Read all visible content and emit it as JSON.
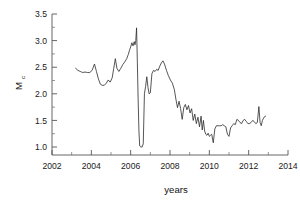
{
  "figure": {
    "background": "#ffffff",
    "line_color": "#2b2b2b",
    "axis_color": "#555555"
  },
  "chart_data": {
    "type": "line",
    "title": "",
    "subtitle": "",
    "xlabel": "years",
    "ylabel": "M",
    "ylabel_subscript": "c",
    "xlim": [
      2002,
      2014
    ],
    "ylim": [
      0.85,
      3.5
    ],
    "xticks": [
      2002,
      2004,
      2006,
      2008,
      2010,
      2012,
      2014
    ],
    "xticklabels": [
      "2002",
      "2004",
      "2006",
      "2008",
      "2010",
      "2012",
      "2014"
    ],
    "yticks": [
      1.0,
      1.5,
      2.0,
      2.5,
      3.0,
      3.5
    ],
    "yticklabels": [
      "1.0",
      "1.5",
      "2.0",
      "2.5",
      "3.0",
      "3.5"
    ],
    "x_minor_ticks": [
      2003,
      2005,
      2007,
      2009,
      2011,
      2013
    ],
    "y_minor_ticks": [
      1.25,
      1.75,
      2.25,
      2.75,
      3.25
    ],
    "grid": false,
    "legend": false,
    "series": [
      {
        "name": "Mc",
        "x": [
          2003.2,
          2003.32,
          2003.44,
          2003.56,
          2003.68,
          2003.8,
          2003.92,
          2004.04,
          2004.16,
          2004.26,
          2004.36,
          2004.46,
          2004.56,
          2004.66,
          2004.76,
          2004.86,
          2004.96,
          2005.06,
          2005.14,
          2005.22,
          2005.3,
          2005.4,
          2005.5,
          2005.6,
          2005.7,
          2005.8,
          2005.88,
          2005.94,
          2006.0,
          2006.06,
          2006.12,
          2006.18,
          2006.22,
          2006.26,
          2006.3,
          2006.34,
          2006.38,
          2006.42,
          2006.46,
          2006.52,
          2006.58,
          2006.64,
          2006.7,
          2006.76,
          2006.82,
          2006.88,
          2006.94,
          2007.0,
          2007.08,
          2007.16,
          2007.24,
          2007.32,
          2007.4,
          2007.48,
          2007.56,
          2007.64,
          2007.72,
          2007.82,
          2007.92,
          2008.02,
          2008.12,
          2008.22,
          2008.3,
          2008.38,
          2008.46,
          2008.54,
          2008.62,
          2008.7,
          2008.78,
          2008.86,
          2008.94,
          2009.02,
          2009.1,
          2009.18,
          2009.26,
          2009.34,
          2009.42,
          2009.5,
          2009.58,
          2009.64,
          2009.7,
          2009.76,
          2009.82,
          2009.88,
          2009.94,
          2010.0,
          2010.06,
          2010.12,
          2010.2,
          2010.28,
          2010.36,
          2010.44,
          2010.52,
          2010.6,
          2010.68,
          2010.76,
          2010.84,
          2010.92,
          2011.0,
          2011.08,
          2011.16,
          2011.24,
          2011.32,
          2011.4,
          2011.48,
          2011.56,
          2011.64,
          2011.72,
          2011.8,
          2011.88,
          2011.96,
          2012.04,
          2012.12,
          2012.2,
          2012.28,
          2012.36,
          2012.44,
          2012.52,
          2012.58,
          2012.64,
          2012.7,
          2012.78,
          2012.86
        ],
        "y": [
          2.48,
          2.44,
          2.42,
          2.4,
          2.41,
          2.4,
          2.4,
          2.44,
          2.56,
          2.42,
          2.28,
          2.18,
          2.16,
          2.16,
          2.2,
          2.26,
          2.22,
          2.3,
          2.48,
          2.66,
          2.48,
          2.42,
          2.48,
          2.55,
          2.6,
          2.66,
          2.74,
          2.82,
          2.88,
          2.96,
          2.9,
          2.98,
          2.92,
          3.0,
          3.24,
          2.6,
          1.9,
          1.3,
          1.02,
          1.0,
          1.0,
          1.06,
          2.0,
          2.14,
          2.32,
          2.12,
          2.0,
          2.02,
          2.38,
          2.44,
          2.42,
          2.46,
          2.44,
          2.52,
          2.58,
          2.62,
          2.56,
          2.44,
          2.34,
          2.26,
          2.2,
          2.08,
          1.9,
          1.74,
          1.86,
          1.72,
          1.52,
          1.74,
          1.8,
          1.7,
          1.78,
          1.64,
          1.72,
          1.5,
          1.62,
          1.44,
          1.56,
          1.38,
          1.58,
          1.32,
          1.5,
          1.3,
          1.24,
          1.22,
          1.26,
          1.2,
          1.22,
          1.24,
          1.08,
          1.34,
          1.4,
          1.4,
          1.4,
          1.4,
          1.42,
          1.4,
          1.38,
          1.24,
          1.2,
          1.36,
          1.4,
          1.44,
          1.42,
          1.52,
          1.5,
          1.46,
          1.44,
          1.5,
          1.52,
          1.48,
          1.44,
          1.44,
          1.46,
          1.5,
          1.48,
          1.44,
          1.46,
          1.76,
          1.46,
          1.4,
          1.5,
          1.56,
          1.58
        ]
      }
    ]
  }
}
